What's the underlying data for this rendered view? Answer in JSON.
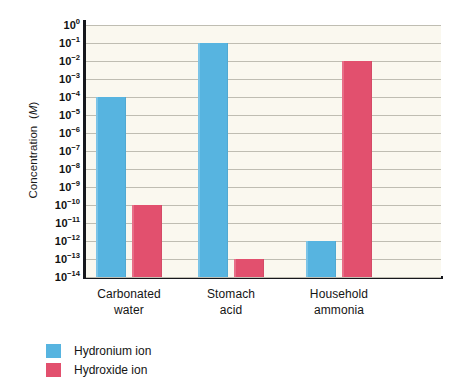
{
  "chart_data": {
    "type": "bar",
    "title": "",
    "xlabel": "",
    "ylabel": "Concentration (M)",
    "ylabel_plain": "Concentration",
    "ylabel_unit": "M",
    "categories": [
      "Carbonated water",
      "Stomach acid",
      "Household ammonia"
    ],
    "categories_lines": [
      [
        "Carbonated",
        "water"
      ],
      [
        "Stomach",
        "acid"
      ],
      [
        "Household",
        "ammonia"
      ]
    ],
    "scale": "log10",
    "ylim": [
      -14,
      0
    ],
    "grid": true,
    "legend_position": "bottom-left",
    "y_tick_labels": [
      "10⁰",
      "10⁻¹",
      "10⁻²",
      "10⁻³",
      "10⁻⁴",
      "10⁻⁵",
      "10⁻⁶",
      "10⁻⁷",
      "10⁻⁸",
      "10⁻⁹",
      "10⁻¹⁰",
      "10⁻¹¹",
      "10⁻¹²",
      "10⁻¹³",
      "10⁻¹⁴"
    ],
    "y_tick_exponents": [
      0,
      -1,
      -2,
      -3,
      -4,
      -5,
      -6,
      -7,
      -8,
      -9,
      -10,
      -11,
      -12,
      -13,
      -14
    ],
    "series": [
      {
        "name": "Hydronium ion",
        "color": "#57b4e0",
        "exponents": [
          -4,
          -1,
          -12
        ],
        "values": [
          "1e-4",
          "1e-1",
          "1e-12"
        ]
      },
      {
        "name": "Hydroxide ion",
        "color": "#e2506e",
        "exponents": [
          -10,
          -13,
          -2
        ],
        "values": [
          "1e-10",
          "1e-13",
          "1e-2"
        ]
      }
    ]
  },
  "legend": {
    "items": [
      {
        "label": "Hydronium ion",
        "color": "#57b4e0"
      },
      {
        "label": "Hydroxide ion",
        "color": "#e2506e"
      }
    ]
  },
  "colors": {
    "hydronium": "#57b4e0",
    "hydroxide": "#e2506e",
    "plot_background": "#faf8ef",
    "gridline": "#bfbdb2",
    "axis": "#16171c",
    "text": "#141414"
  }
}
